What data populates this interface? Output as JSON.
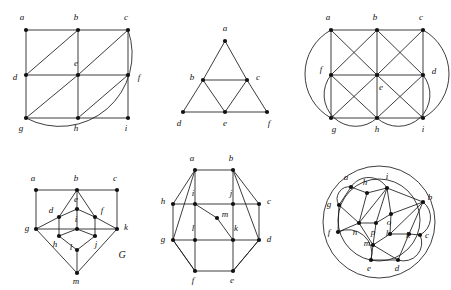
{
  "figure": {
    "background_color": "#ffffff",
    "ink_color": "#111111",
    "panel_count": 6
  },
  "panels": [
    {
      "id": "panel-1",
      "name": "grid-graph-with-arc",
      "caption": "",
      "x": 8,
      "y": 8,
      "width": 140,
      "height": 125,
      "vertices": [
        {
          "id": "a",
          "label": "a",
          "x": 18,
          "y": 22,
          "lx": 14,
          "ly": 10
        },
        {
          "id": "b",
          "label": "b",
          "x": 70,
          "y": 22,
          "lx": 68,
          "ly": 10
        },
        {
          "id": "c",
          "label": "c",
          "x": 120,
          "y": 22,
          "lx": 118,
          "ly": 10
        },
        {
          "id": "d",
          "label": "d",
          "x": 18,
          "y": 67,
          "lx": 7,
          "ly": 70
        },
        {
          "id": "e",
          "label": "e",
          "x": 70,
          "y": 67,
          "lx": 68,
          "ly": 56
        },
        {
          "id": "f",
          "label": "f",
          "x": 120,
          "y": 67,
          "lx": 131,
          "ly": 70
        },
        {
          "id": "g",
          "label": "g",
          "x": 18,
          "y": 110,
          "lx": 13,
          "ly": 121
        },
        {
          "id": "h",
          "label": "h",
          "x": 70,
          "y": 110,
          "lx": 68,
          "ly": 121
        },
        {
          "id": "i",
          "label": "i",
          "x": 120,
          "y": 110,
          "lx": 118,
          "ly": 121
        }
      ],
      "edges": [
        [
          "a",
          "b"
        ],
        [
          "b",
          "c"
        ],
        [
          "d",
          "e"
        ],
        [
          "e",
          "f"
        ],
        [
          "g",
          "h"
        ],
        [
          "h",
          "i"
        ],
        [
          "a",
          "d"
        ],
        [
          "d",
          "g"
        ],
        [
          "b",
          "e"
        ],
        [
          "e",
          "h"
        ],
        [
          "c",
          "f"
        ],
        [
          "f",
          "i"
        ],
        [
          "d",
          "b"
        ],
        [
          "e",
          "c"
        ],
        [
          "g",
          "e"
        ],
        [
          "h",
          "f"
        ]
      ],
      "arcs": [
        {
          "from": "c",
          "to": "g",
          "name": "outer-arc-c-g",
          "sweep": 1,
          "bow": 46
        }
      ]
    },
    {
      "id": "panel-2",
      "name": "sierpinski-triangle-graph",
      "caption": "",
      "x": 165,
      "y": 8,
      "width": 120,
      "height": 125,
      "vertices": [
        {
          "id": "a",
          "label": "a",
          "x": 60,
          "y": 33,
          "lx": 60,
          "ly": 21
        },
        {
          "id": "b",
          "label": "b",
          "x": 38,
          "y": 72,
          "lx": 27,
          "ly": 70
        },
        {
          "id": "c",
          "label": "c",
          "x": 82,
          "y": 72,
          "lx": 93,
          "ly": 70
        },
        {
          "id": "d",
          "label": "d",
          "x": 18,
          "y": 104,
          "lx": 14,
          "ly": 116
        },
        {
          "id": "e",
          "label": "e",
          "x": 60,
          "y": 104,
          "lx": 60,
          "ly": 116
        },
        {
          "id": "f",
          "label": "f",
          "x": 102,
          "y": 104,
          "lx": 104,
          "ly": 116
        }
      ],
      "edges": [
        [
          "a",
          "b"
        ],
        [
          "a",
          "c"
        ],
        [
          "b",
          "c"
        ],
        [
          "b",
          "d"
        ],
        [
          "b",
          "e"
        ],
        [
          "c",
          "e"
        ],
        [
          "c",
          "f"
        ],
        [
          "d",
          "e"
        ],
        [
          "e",
          "f"
        ]
      ],
      "arcs": []
    },
    {
      "id": "panel-3",
      "name": "grid-graph-all-diagonals-two-arcs",
      "caption": "",
      "x": 303,
      "y": 8,
      "width": 145,
      "height": 125,
      "vertices": [
        {
          "id": "a",
          "label": "a",
          "x": 28,
          "y": 22,
          "lx": 25,
          "ly": 10
        },
        {
          "id": "b",
          "label": "b",
          "x": 74,
          "y": 22,
          "lx": 72,
          "ly": 10
        },
        {
          "id": "c",
          "label": "c",
          "x": 120,
          "y": 22,
          "lx": 118,
          "ly": 10
        },
        {
          "id": "f",
          "label": "f",
          "x": 28,
          "y": 67,
          "lx": 18,
          "ly": 62
        },
        {
          "id": "e",
          "label": "e",
          "x": 74,
          "y": 67,
          "lx": 78,
          "ly": 80
        },
        {
          "id": "d",
          "label": "d",
          "x": 120,
          "y": 67,
          "lx": 131,
          "ly": 64
        },
        {
          "id": "g",
          "label": "g",
          "x": 28,
          "y": 110,
          "lx": 31,
          "ly": 122
        },
        {
          "id": "h",
          "label": "h",
          "x": 74,
          "y": 110,
          "lx": 74,
          "ly": 122
        },
        {
          "id": "i",
          "label": "i",
          "x": 120,
          "y": 110,
          "lx": 120,
          "ly": 122
        }
      ],
      "edges": [
        [
          "a",
          "b"
        ],
        [
          "b",
          "c"
        ],
        [
          "f",
          "e"
        ],
        [
          "e",
          "d"
        ],
        [
          "g",
          "h"
        ],
        [
          "h",
          "i"
        ],
        [
          "a",
          "f"
        ],
        [
          "f",
          "g"
        ],
        [
          "b",
          "e"
        ],
        [
          "e",
          "h"
        ],
        [
          "c",
          "d"
        ],
        [
          "d",
          "i"
        ],
        [
          "a",
          "e"
        ],
        [
          "f",
          "b"
        ],
        [
          "b",
          "d"
        ],
        [
          "e",
          "c"
        ],
        [
          "f",
          "h"
        ],
        [
          "g",
          "e"
        ],
        [
          "e",
          "i"
        ],
        [
          "h",
          "d"
        ]
      ],
      "arcs": [
        {
          "from": "a",
          "to": "g",
          "name": "outer-arc-a-g",
          "sweep": 0,
          "bow": 26
        },
        {
          "from": "c",
          "to": "i",
          "name": "outer-arc-c-i",
          "sweep": 1,
          "bow": 26
        },
        {
          "from": "f",
          "to": "h",
          "name": "outer-arc-f-h",
          "sweep": 0,
          "bow": 34
        },
        {
          "from": "d",
          "to": "h",
          "name": "outer-arc-d-h",
          "sweep": 1,
          "bow": 34
        }
      ]
    },
    {
      "id": "panel-4",
      "name": "graph-G-thirteen-vertices",
      "caption": "G",
      "caption_x": 108,
      "caption_y": 98,
      "x": 14,
      "y": 158,
      "width": 135,
      "height": 128,
      "vertices": [
        {
          "id": "a",
          "label": "a",
          "x": 22,
          "y": 32,
          "lx": 19,
          "ly": 21
        },
        {
          "id": "b",
          "label": "b",
          "x": 63,
          "y": 32,
          "lx": 62,
          "ly": 21
        },
        {
          "id": "c",
          "label": "c",
          "x": 103,
          "y": 32,
          "lx": 101,
          "ly": 21
        },
        {
          "id": "e",
          "label": "e",
          "x": 63,
          "y": 51,
          "lx": 62,
          "ly": 42
        },
        {
          "id": "d",
          "label": "d",
          "x": 45,
          "y": 59,
          "lx": 37,
          "ly": 53
        },
        {
          "id": "f",
          "label": "f",
          "x": 81,
          "y": 59,
          "lx": 88,
          "ly": 53
        },
        {
          "id": "g",
          "label": "g",
          "x": 22,
          "y": 71,
          "lx": 13,
          "ly": 71
        },
        {
          "id": "i",
          "label": "i",
          "x": 63,
          "y": 71,
          "lx": 62,
          "ly": 62
        },
        {
          "id": "k",
          "label": "k",
          "x": 103,
          "y": 71,
          "lx": 112,
          "ly": 70
        },
        {
          "id": "h",
          "label": "h",
          "x": 45,
          "y": 78,
          "lx": 41,
          "ly": 87
        },
        {
          "id": "j",
          "label": "j",
          "x": 81,
          "y": 78,
          "lx": 82,
          "ly": 87
        },
        {
          "id": "l",
          "label": "l",
          "x": 63,
          "y": 92,
          "lx": 57,
          "ly": 90
        },
        {
          "id": "m",
          "label": "m",
          "x": 63,
          "y": 115,
          "lx": 62,
          "ly": 124
        }
      ],
      "edges": [
        [
          "a",
          "b"
        ],
        [
          "b",
          "c"
        ],
        [
          "a",
          "g"
        ],
        [
          "c",
          "k"
        ],
        [
          "g",
          "i"
        ],
        [
          "i",
          "k"
        ],
        [
          "b",
          "d"
        ],
        [
          "b",
          "f"
        ],
        [
          "b",
          "e"
        ],
        [
          "d",
          "e"
        ],
        [
          "e",
          "f"
        ],
        [
          "d",
          "g"
        ],
        [
          "f",
          "k"
        ],
        [
          "d",
          "h"
        ],
        [
          "f",
          "j"
        ],
        [
          "e",
          "i"
        ],
        [
          "h",
          "i"
        ],
        [
          "i",
          "j"
        ],
        [
          "h",
          "l"
        ],
        [
          "j",
          "l"
        ],
        [
          "l",
          "m"
        ],
        [
          "g",
          "m"
        ],
        [
          "k",
          "m"
        ]
      ],
      "arcs": []
    },
    {
      "id": "panel-5",
      "name": "octagon-graph-thirteen-vertices",
      "caption": "",
      "x": 155,
      "y": 148,
      "width": 145,
      "height": 140,
      "vertices": [
        {
          "id": "a",
          "label": "a",
          "x": 40,
          "y": 22,
          "lx": 37,
          "ly": 11
        },
        {
          "id": "b",
          "label": "b",
          "x": 78,
          "y": 22,
          "lx": 76,
          "ly": 11
        },
        {
          "id": "h",
          "label": "h",
          "x": 18,
          "y": 56,
          "lx": 8,
          "ly": 54
        },
        {
          "id": "i",
          "label": "i",
          "x": 40,
          "y": 56,
          "lx": 38,
          "ly": 46
        },
        {
          "id": "j",
          "label": "j",
          "x": 78,
          "y": 56,
          "lx": 76,
          "ly": 46
        },
        {
          "id": "c",
          "label": "c",
          "x": 104,
          "y": 56,
          "lx": 114,
          "ly": 54
        },
        {
          "id": "m",
          "label": "m",
          "x": 62,
          "y": 70,
          "lx": 70,
          "ly": 67
        },
        {
          "id": "g",
          "label": "g",
          "x": 18,
          "y": 92,
          "lx": 8,
          "ly": 92
        },
        {
          "id": "l",
          "label": "l",
          "x": 40,
          "y": 92,
          "lx": 38,
          "ly": 81
        },
        {
          "id": "k",
          "label": "k",
          "x": 78,
          "y": 92,
          "lx": 81,
          "ly": 81
        },
        {
          "id": "d",
          "label": "d",
          "x": 104,
          "y": 92,
          "lx": 114,
          "ly": 92
        },
        {
          "id": "f",
          "label": "f",
          "x": 40,
          "y": 123,
          "lx": 38,
          "ly": 133
        },
        {
          "id": "e",
          "label": "e",
          "x": 78,
          "y": 123,
          "lx": 77,
          "ly": 133
        }
      ],
      "edges": [
        [
          "a",
          "b"
        ],
        [
          "b",
          "c"
        ],
        [
          "c",
          "d"
        ],
        [
          "d",
          "e"
        ],
        [
          "e",
          "f"
        ],
        [
          "f",
          "g"
        ],
        [
          "g",
          "h"
        ],
        [
          "h",
          "a"
        ],
        [
          "h",
          "i"
        ],
        [
          "i",
          "j"
        ],
        [
          "j",
          "c"
        ],
        [
          "g",
          "l"
        ],
        [
          "l",
          "k"
        ],
        [
          "k",
          "d"
        ],
        [
          "a",
          "i"
        ],
        [
          "i",
          "l"
        ],
        [
          "l",
          "f"
        ],
        [
          "b",
          "j"
        ],
        [
          "j",
          "k"
        ],
        [
          "k",
          "e"
        ],
        [
          "a",
          "g"
        ],
        [
          "b",
          "d"
        ],
        [
          "i",
          "m"
        ],
        [
          "m",
          "k"
        ],
        [
          "g",
          "f"
        ],
        [
          "e",
          "d"
        ]
      ],
      "arcs": []
    },
    {
      "id": "panel-6",
      "name": "double-circle-graph-sixteen-vertices",
      "caption": "",
      "x": 305,
      "y": 150,
      "width": 143,
      "height": 138,
      "vertices": [
        {
          "id": "a",
          "label": "a",
          "x": 46,
          "y": 37,
          "lx": 41,
          "ly": 28
        },
        {
          "id": "h",
          "label": "h",
          "x": 62,
          "y": 43,
          "lx": 60,
          "ly": 33
        },
        {
          "id": "i",
          "label": "i",
          "x": 82,
          "y": 38,
          "lx": 82,
          "ly": 27
        },
        {
          "id": "b",
          "label": "b",
          "x": 118,
          "y": 52,
          "lx": 125,
          "ly": 48
        },
        {
          "id": "g",
          "label": "g",
          "x": 34,
          "y": 55,
          "lx": 24,
          "ly": 55
        },
        {
          "id": "o",
          "label": "o",
          "x": 86,
          "y": 64,
          "lx": 84,
          "ly": 73
        },
        {
          "id": "n",
          "label": "n",
          "x": 54,
          "y": 73,
          "lx": 50,
          "ly": 83
        },
        {
          "id": "p",
          "label": "p",
          "x": 71,
          "y": 73,
          "lx": 68,
          "ly": 83
        },
        {
          "id": "f",
          "label": "f",
          "x": 33,
          "y": 82,
          "lx": 24,
          "ly": 83
        },
        {
          "id": "l",
          "label": "l",
          "x": 85,
          "y": 84,
          "lx": 82,
          "ly": 84
        },
        {
          "id": "k",
          "label": "k",
          "x": 104,
          "y": 84,
          "lx": 103,
          "ly": 86
        },
        {
          "id": "c",
          "label": "c",
          "x": 115,
          "y": 85,
          "lx": 122,
          "ly": 86
        },
        {
          "id": "m",
          "label": "m",
          "x": 68,
          "y": 95,
          "lx": 62,
          "ly": 94
        },
        {
          "id": "e",
          "label": "e",
          "x": 66,
          "y": 110,
          "lx": 64,
          "ly": 119
        },
        {
          "id": "d",
          "label": "d",
          "x": 93,
          "y": 110,
          "lx": 92,
          "ly": 119
        }
      ],
      "edges": [
        [
          "a",
          "h"
        ],
        [
          "h",
          "i"
        ],
        [
          "i",
          "b"
        ],
        [
          "a",
          "g"
        ],
        [
          "g",
          "n"
        ],
        [
          "g",
          "f"
        ],
        [
          "f",
          "n"
        ],
        [
          "n",
          "p"
        ],
        [
          "p",
          "m"
        ],
        [
          "m",
          "e"
        ],
        [
          "m",
          "d"
        ],
        [
          "e",
          "d"
        ],
        [
          "i",
          "o"
        ],
        [
          "o",
          "b"
        ],
        [
          "o",
          "l"
        ],
        [
          "l",
          "k"
        ],
        [
          "k",
          "b"
        ],
        [
          "k",
          "c"
        ],
        [
          "l",
          "m"
        ],
        [
          "i",
          "n"
        ],
        [
          "i",
          "p"
        ],
        [
          "p",
          "o"
        ],
        [
          "b",
          "l"
        ],
        [
          "h",
          "n"
        ],
        [
          "n",
          "m"
        ],
        [
          "d",
          "k"
        ]
      ],
      "arcs": [
        {
          "from": "a",
          "to": "i",
          "name": "inner-arc-a-i",
          "sweep": 1,
          "bow": 10
        },
        {
          "from": "g",
          "to": "a",
          "name": "inner-arc-g-a",
          "sweep": 1,
          "bow": 7
        },
        {
          "from": "b",
          "to": "c",
          "name": "inner-arc-b-c",
          "sweep": 1,
          "bow": 9
        },
        {
          "from": "f",
          "to": "e",
          "name": "inner-arc-f-e",
          "sweep": 1,
          "bow": 14
        },
        {
          "from": "c",
          "to": "d",
          "name": "inner-arc-c-d",
          "sweep": 1,
          "bow": 11
        }
      ],
      "circles": [
        {
          "name": "outer-circle",
          "cx": 74,
          "cy": 72,
          "r": 56
        },
        {
          "name": "inner-circle",
          "cx": 74,
          "cy": 70,
          "r": 41
        }
      ]
    }
  ]
}
